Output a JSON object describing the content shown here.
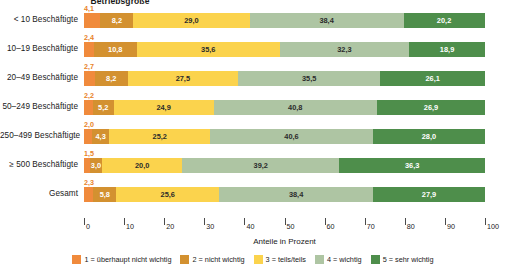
{
  "group_title": "Betriebsgröße",
  "axis": {
    "title": "Anteile in Prozent",
    "ticks": [
      "0",
      "10",
      "20",
      "30",
      "40",
      "50",
      "60",
      "70",
      "80",
      "90",
      "100"
    ],
    "min": 0,
    "max": 100
  },
  "legend": {
    "items": [
      {
        "label": "1 = überhaupt nicht wichtig",
        "color": "#f08a3c"
      },
      {
        "label": "2 = nicht wichtig",
        "color": "#d39130"
      },
      {
        "label": "3 = teils/teils",
        "color": "#fbd34d"
      },
      {
        "label": "4 = wichtig",
        "color": "#aec5a3"
      },
      {
        "label": "5 = sehr wichtig",
        "color": "#4e8e4b"
      }
    ]
  },
  "chart_data": {
    "type": "bar",
    "orientation": "horizontal",
    "stacked": true,
    "title": "Betriebsgröße",
    "xlabel": "Anteile in Prozent",
    "ylabel": "",
    "xlim": [
      0,
      100
    ],
    "grid": false,
    "legend_position": "bottom",
    "categories": [
      "< 10 Beschäftigte",
      "10–19 Beschäftigte",
      "20–49 Beschäftigte",
      "50–249 Beschäftigte",
      "250–499 Beschäftigte",
      "≥ 500 Beschäftigte",
      "Gesamt"
    ],
    "series": [
      {
        "name": "1 = überhaupt nicht wichtig",
        "color": "#f08a3c",
        "values": [
          4.1,
          2.4,
          2.7,
          2.2,
          2.0,
          1.5,
          2.3
        ],
        "labels": [
          "4,1",
          "2,4",
          "2,7",
          "2,2",
          "2,0",
          "1,5",
          "2,3"
        ]
      },
      {
        "name": "2 = nicht wichtig",
        "color": "#d39130",
        "values": [
          8.2,
          10.8,
          8.2,
          5.2,
          4.3,
          3.0,
          5.8
        ],
        "labels": [
          "8,2",
          "10,8",
          "8,2",
          "5,2",
          "4,3",
          "3,0",
          "5,8"
        ]
      },
      {
        "name": "3 = teils/teils",
        "color": "#fbd34d",
        "values": [
          29.0,
          35.6,
          27.5,
          24.9,
          25.2,
          20.0,
          25.6
        ],
        "labels": [
          "29,0",
          "35,6",
          "27,5",
          "24,9",
          "25,2",
          "20,0",
          "25,6"
        ]
      },
      {
        "name": "4 = wichtig",
        "color": "#aec5a3",
        "values": [
          38.4,
          32.3,
          35.5,
          40.8,
          40.6,
          39.2,
          38.4
        ],
        "labels": [
          "38,4",
          "32,3",
          "35,5",
          "40,8",
          "40,6",
          "39,2",
          "38,4"
        ]
      },
      {
        "name": "5 = sehr wichtig",
        "color": "#4e8e4b",
        "values": [
          20.2,
          18.9,
          26.1,
          26.9,
          28.0,
          36.3,
          27.9
        ],
        "labels": [
          "20,2",
          "18,9",
          "26,1",
          "26,9",
          "28,0",
          "36,3",
          "27,9"
        ]
      }
    ]
  }
}
